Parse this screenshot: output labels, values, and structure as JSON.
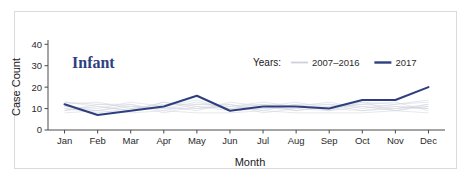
{
  "panel": {
    "title": "Infant",
    "title_color": "#2e3f7f",
    "frame_color": "#d8dade"
  },
  "legend": {
    "title": "Years:",
    "position": "top-right",
    "entries": [
      {
        "label": "2007–2016",
        "color": "#cfd0dd"
      },
      {
        "label": "2017",
        "color": "#2e3f7f"
      }
    ]
  },
  "chart_data": {
    "type": "line",
    "title": "Infant",
    "xlabel": "Month",
    "ylabel": "Case Count",
    "categories": [
      "Jan",
      "Feb",
      "Mar",
      "Apr",
      "May",
      "Jun",
      "Jul",
      "Aug",
      "Sep",
      "Oct",
      "Nov",
      "Dec"
    ],
    "ylim": [
      0,
      42
    ],
    "yticks": [
      0,
      10,
      20,
      30,
      40
    ],
    "ytick_labels": [
      "0",
      "10",
      "20",
      "30",
      "40"
    ],
    "xtick_labels": [
      "Jan",
      "Feb",
      "Mar",
      "Apr",
      "May",
      "Jun",
      "Jul",
      "Aug",
      "Sep",
      "Oct",
      "Nov",
      "Dec"
    ],
    "grid": false,
    "legend_position": "top-right",
    "series": [
      {
        "name": "2017",
        "color": "#2e3f7f",
        "emphasis": true,
        "values": [
          12,
          7,
          9,
          11,
          16,
          9,
          11,
          11,
          10,
          14,
          14,
          20
        ]
      },
      {
        "name": "2007",
        "color": "#cfd0dd",
        "emphasis": false,
        "values": [
          10,
          9,
          12,
          8,
          11,
          9,
          10,
          12,
          9,
          11,
          10,
          12
        ]
      },
      {
        "name": "2008",
        "color": "#cfd0dd",
        "emphasis": false,
        "values": [
          13,
          11,
          9,
          13,
          10,
          12,
          8,
          10,
          12,
          9,
          11,
          10
        ]
      },
      {
        "name": "2009",
        "color": "#cfd0dd",
        "emphasis": false,
        "values": [
          9,
          12,
          11,
          10,
          13,
          10,
          12,
          9,
          11,
          13,
          9,
          11
        ]
      },
      {
        "name": "2010",
        "color": "#cfd0dd",
        "emphasis": false,
        "values": [
          11,
          10,
          13,
          11,
          9,
          13,
          11,
          13,
          10,
          12,
          13,
          9
        ]
      },
      {
        "name": "2011",
        "color": "#cfd0dd",
        "emphasis": false,
        "values": [
          12,
          13,
          10,
          12,
          12,
          11,
          13,
          11,
          13,
          10,
          12,
          13
        ]
      },
      {
        "name": "2012",
        "color": "#cfd0dd",
        "emphasis": false,
        "values": [
          8,
          9,
          8,
          9,
          8,
          8,
          9,
          8,
          8,
          8,
          9,
          8
        ]
      },
      {
        "name": "2013",
        "color": "#cfd0dd",
        "emphasis": false,
        "values": [
          10,
          8,
          10,
          11,
          14,
          9,
          10,
          10,
          9,
          13,
          12,
          14
        ]
      },
      {
        "name": "2014",
        "color": "#cfd0dd",
        "emphasis": false,
        "values": [
          13,
          12,
          12,
          9,
          12,
          12,
          9,
          12,
          12,
          11,
          9,
          12
        ]
      },
      {
        "name": "2015",
        "color": "#cfd0dd",
        "emphasis": false,
        "values": [
          9,
          11,
          9,
          13,
          11,
          10,
          11,
          9,
          11,
          12,
          11,
          10
        ]
      },
      {
        "name": "2016",
        "color": "#cfd0dd",
        "emphasis": false,
        "values": [
          11,
          9,
          11,
          10,
          10,
          11,
          12,
          11,
          10,
          9,
          10,
          11
        ]
      }
    ]
  }
}
